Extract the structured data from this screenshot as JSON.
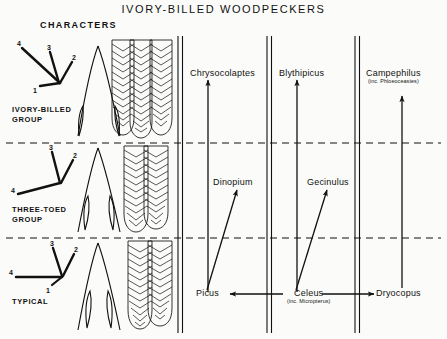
{
  "figure": {
    "title": "IVORY-BILLED  WOODPECKERS",
    "characters_header": "CHARACTERS",
    "background_color": "#fbfbf9",
    "ink_color": "#111111"
  },
  "rows": [
    {
      "id": "ivory-billed",
      "group_label": "IVORY-BILLED\nGROUP",
      "toe_diagram": {
        "name": "toe-arrangement-ivory-billed",
        "toe_labels": [
          "1",
          "2",
          "3",
          "4"
        ],
        "description": "four-toed, toe 4 directed strongly backward-outward, toe 3 vertical"
      },
      "skull_diagram": {
        "name": "skull-outline-ivory-billed"
      },
      "tail_diagram": {
        "name": "tail-feathers-ivory-billed",
        "feather_count": 3
      }
    },
    {
      "id": "three-toed",
      "group_label": "THREE-TOED\nGROUP",
      "toe_diagram": {
        "name": "toe-arrangement-three-toed",
        "toe_labels": [
          "2",
          "3",
          "4"
        ],
        "description": "three toes, hallux (toe 1) absent, toe 4 directed backward"
      },
      "skull_diagram": {
        "name": "skull-outline-three-toed"
      },
      "tail_diagram": {
        "name": "tail-feathers-three-toed",
        "feather_count": 2
      }
    },
    {
      "id": "typical",
      "group_label": "TYPICAL",
      "toe_diagram": {
        "name": "toe-arrangement-typical",
        "toe_labels": [
          "1",
          "2",
          "3",
          "4"
        ],
        "description": "zygodactyl, toe 4 horizontal backward, toe 1 short"
      },
      "skull_diagram": {
        "name": "skull-outline-typical"
      },
      "tail_diagram": {
        "name": "tail-feathers-typical",
        "feather_count": 2
      }
    }
  ],
  "taxa": [
    {
      "id": "chrysocolaptes",
      "name": "Chrysocolaptes",
      "sub": "",
      "column": 1,
      "row": "ivory-billed"
    },
    {
      "id": "blythipicus",
      "name": "Blythipicus",
      "sub": "",
      "column": 2,
      "row": "ivory-billed"
    },
    {
      "id": "campephilus",
      "name": "Campephilus",
      "sub": "(inc. Phloeoceastes)",
      "column": 3,
      "row": "ivory-billed"
    },
    {
      "id": "dinopium",
      "name": "Dinopium",
      "sub": "",
      "column": 1,
      "row": "three-toed"
    },
    {
      "id": "gecinulus",
      "name": "Gecinulus",
      "sub": "",
      "column": 2,
      "row": "three-toed"
    },
    {
      "id": "picus",
      "name": "Picus",
      "sub": "",
      "column": 1,
      "row": "typical"
    },
    {
      "id": "celeus",
      "name": "Celeus",
      "sub": "(inc. Micropterus)",
      "column": 2,
      "row": "typical"
    },
    {
      "id": "dryocopus",
      "name": "Dryocopus",
      "sub": "",
      "column": 3,
      "row": "typical"
    }
  ],
  "arrows": [
    {
      "id": "picus-to-chrysocolaptes",
      "from": "Picus",
      "to": "Chrysocolaptes",
      "direction": "up"
    },
    {
      "id": "picus-to-dinopium",
      "from": "Picus",
      "to": "Dinopium",
      "direction": "up-right"
    },
    {
      "id": "celeus-to-blythipicus",
      "from": "Celeus",
      "to": "Blythipicus",
      "direction": "up"
    },
    {
      "id": "celeus-to-gecinulus",
      "from": "Celeus",
      "to": "Gecinulus",
      "direction": "up-right"
    },
    {
      "id": "celeus-to-picus",
      "from": "Celeus",
      "to": "Picus",
      "direction": "left"
    },
    {
      "id": "celeus-to-dryocopus",
      "from": "Celeus",
      "to": "Dryocopus",
      "direction": "right"
    },
    {
      "id": "dryocopus-to-campephilus",
      "from": "Dryocopus",
      "to": "Campephilus",
      "direction": "up"
    }
  ],
  "dividers": {
    "vertical_double_lines": 4,
    "horizontal_dashed_lines": 2
  }
}
